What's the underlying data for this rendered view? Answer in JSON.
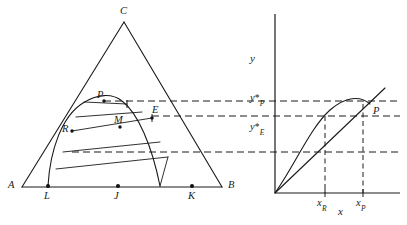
{
  "figure": {
    "background_color": "#ffffff",
    "line_color": "#1a1a1a",
    "width": 407,
    "height": 225
  },
  "left_panel": {
    "name": "triangle-diagram",
    "triangle_vertices": [
      {
        "label": "A",
        "x": 22,
        "y": 187
      },
      {
        "label": "B",
        "x": 222,
        "y": 187
      },
      {
        "label": "C",
        "x": 124,
        "y": 22
      }
    ],
    "base_points": [
      {
        "label": "L",
        "x": 48,
        "y": 186
      },
      {
        "label": "J",
        "x": 118,
        "y": 186
      },
      {
        "label": "K",
        "x": 192,
        "y": 186
      }
    ],
    "interior_points": [
      {
        "label": "P",
        "x": 103,
        "y": 101
      },
      {
        "label": "M",
        "x": 120,
        "y": 124
      },
      {
        "label": "E",
        "x": 152,
        "y": 117
      },
      {
        "label": "R",
        "x": 72,
        "y": 131
      }
    ],
    "labels": {
      "A": "A",
      "B": "B",
      "C": "C",
      "L": "L",
      "J": "J",
      "K": "K",
      "P": "P",
      "M": "M",
      "E": "E",
      "R": "R"
    },
    "chord_count": 5
  },
  "right_panel": {
    "name": "phase-diagram",
    "axis_labels": {
      "y": "y",
      "x": "x"
    },
    "y_ticks": [
      {
        "label_main": "y",
        "label_star": "*",
        "label_sub": "P",
        "y": 103
      },
      {
        "label_main": "y",
        "label_star": "*",
        "label_sub": "E",
        "y": 116
      }
    ],
    "x_ticks": [
      {
        "label_main": "x",
        "label_sub": "R",
        "x": 325
      },
      {
        "label_main": "x",
        "label_sub": "P",
        "x": 363
      }
    ],
    "curve_point_label": "P",
    "origin": {
      "x": 275,
      "y": 193
    },
    "has_45_degree_line": true,
    "has_concave_curve": true
  },
  "connector_lines": {
    "name": "dashed-connectors",
    "count": 3,
    "y_positions": [
      103,
      116,
      152
    ]
  }
}
